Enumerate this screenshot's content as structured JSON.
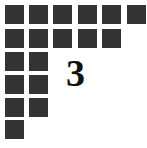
{
  "puzzle": {
    "number_label": "3",
    "square_color": "#333333",
    "rows": [
      6,
      5,
      2,
      2,
      2,
      1
    ]
  }
}
